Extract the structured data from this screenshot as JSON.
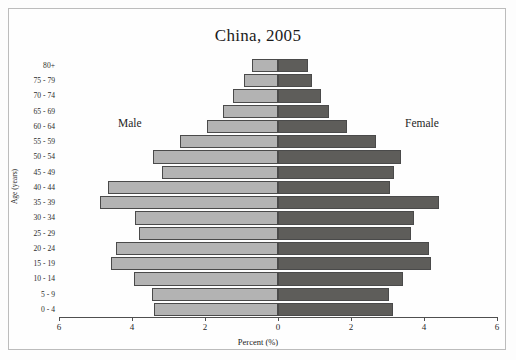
{
  "figure": {
    "title": "China, 2005",
    "x_axis_title": "Percent (%)",
    "y_axis_title": "Age (years)",
    "male_label": "Male",
    "female_label": "Female",
    "male_color": "#b3b3b3",
    "female_color": "#5e5d5a",
    "axis_color": "#4f4f4f"
  },
  "x_ticks": [
    {
      "label": "6",
      "value": -6
    },
    {
      "label": "4",
      "value": -4
    },
    {
      "label": "2",
      "value": -2
    },
    {
      "label": "0",
      "value": 0
    },
    {
      "label": "2",
      "value": 2
    },
    {
      "label": "4",
      "value": 4
    },
    {
      "label": "6",
      "value": 6
    }
  ],
  "chart_data": {
    "type": "bar",
    "subtype": "population-pyramid",
    "title": "China, 2005",
    "xlabel": "Percent (%)",
    "ylabel": "Age (years)",
    "xlim": [
      -6,
      6
    ],
    "xtick_labels": [
      "6",
      "4",
      "2",
      "0",
      "2",
      "4",
      "6"
    ],
    "grid": false,
    "legend": "in-plot text annotations: Male (left), Female (right)",
    "categories": [
      "80+",
      "75 - 79",
      "70 - 74",
      "65 - 69",
      "60 - 64",
      "55 - 59",
      "50 - 54",
      "45 - 49",
      "40 - 44",
      "35 - 39",
      "30 - 34",
      "25 - 29",
      "20 - 24",
      "15 - 19",
      "10 - 14",
      "5 - 9",
      "0 - 4"
    ],
    "series": [
      {
        "name": "Male",
        "direction": "left",
        "color": "#b3b3b3",
        "values": [
          0.72,
          0.94,
          1.22,
          1.5,
          1.94,
          2.69,
          3.42,
          3.17,
          4.67,
          4.89,
          3.92,
          3.81,
          4.44,
          4.58,
          3.94,
          3.44,
          3.39
        ]
      },
      {
        "name": "Female",
        "direction": "right",
        "color": "#5e5d5a",
        "values": [
          0.83,
          0.94,
          1.17,
          1.39,
          1.89,
          2.69,
          3.36,
          3.17,
          3.08,
          4.42,
          3.72,
          3.64,
          4.14,
          4.19,
          3.42,
          3.03,
          3.14
        ]
      }
    ]
  }
}
